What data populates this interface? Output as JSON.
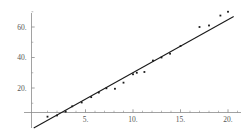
{
  "chart_data": {
    "type": "scatter",
    "title": "",
    "subtitle": "",
    "xlabel": "",
    "ylabel": "",
    "xlim": [
      -0.7,
      21.3
    ],
    "ylim": [
      -9.0,
      72.0
    ],
    "grid": false,
    "legend": null,
    "axis_style": "mathematica-crossing-axes",
    "x_ticks": [
      5,
      10,
      15,
      20
    ],
    "x_tick_labels": [
      "5.",
      "10.",
      "15.",
      "20."
    ],
    "y_ticks": [
      20,
      40,
      60
    ],
    "y_tick_labels": [
      "20.",
      "40.",
      "60."
    ],
    "x_minor_ticks": [
      1,
      2,
      3,
      4,
      6,
      7,
      8,
      9,
      11,
      12,
      13,
      14,
      16,
      17,
      18,
      19,
      21
    ],
    "y_minor_ticks": [
      10,
      30,
      50,
      70
    ],
    "series": [
      {
        "name": "data points",
        "type": "scatter",
        "marker": "point",
        "color": "#1a1a1a",
        "points": [
          [
            1.0,
            1.2
          ],
          [
            2.0,
            2.0
          ],
          [
            2.9,
            4.5
          ],
          [
            3.6,
            8.0
          ],
          [
            4.6,
            10.5
          ],
          [
            5.6,
            14.0
          ],
          [
            6.4,
            17.0
          ],
          [
            7.2,
            19.8
          ],
          [
            8.1,
            19.5
          ],
          [
            9.0,
            23.5
          ],
          [
            10.0,
            29.0
          ],
          [
            10.4,
            30.0
          ],
          [
            11.2,
            30.5
          ],
          [
            12.1,
            38.0
          ],
          [
            13.0,
            40.0
          ],
          [
            13.9,
            42.5
          ],
          [
            15.0,
            47.5
          ],
          [
            17.0,
            60.0
          ],
          [
            18.0,
            61.0
          ],
          [
            19.2,
            67.5
          ],
          [
            20.0,
            70.0
          ]
        ]
      },
      {
        "name": "fitted line",
        "type": "line",
        "color": "#1a1a1a",
        "fit": "linear",
        "slope": 3.47,
        "intercept": -4.6,
        "endpoints": [
          [
            -0.45,
            -6.2
          ],
          [
            20.6,
            66.9
          ]
        ]
      }
    ]
  },
  "colors": {
    "axis": "#8a8a8a",
    "data": "#1a1a1a",
    "line": "#1a1a1a",
    "tick_label": "#555555",
    "background": "#ffffff"
  }
}
